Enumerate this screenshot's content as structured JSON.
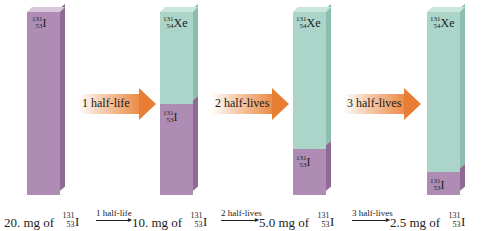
{
  "colors": {
    "iodine": "#ae8cb3",
    "xenon": "#aad5c8",
    "arrow": "#e87e35"
  },
  "nuclides": {
    "iodine": {
      "mass": "131",
      "atomic": "53",
      "symbol": "I"
    },
    "xenon": {
      "mass": "131",
      "atomic": "54",
      "symbol": "Xe"
    }
  },
  "bars": [
    {
      "iodine_fraction": 1.0,
      "xenon_fraction": 0.0,
      "iodine_label": true,
      "xenon_label": false
    },
    {
      "iodine_fraction": 0.5,
      "xenon_fraction": 0.5,
      "iodine_label": true,
      "xenon_label": true
    },
    {
      "iodine_fraction": 0.25,
      "xenon_fraction": 0.75,
      "iodine_label": true,
      "xenon_label": true
    },
    {
      "iodine_fraction": 0.125,
      "xenon_fraction": 0.875,
      "iodine_label": true,
      "xenon_label": true
    }
  ],
  "arrows": [
    {
      "label": "1 half-life"
    },
    {
      "label": "2 half-lives"
    },
    {
      "label": "3 half-lives"
    }
  ],
  "equation": {
    "amounts": [
      "20. mg of",
      "10. mg of",
      "5.0 mg of",
      "2.5 mg of"
    ],
    "steps": [
      "1 half-life",
      "2 half-lives",
      "3 half-lives"
    ]
  }
}
